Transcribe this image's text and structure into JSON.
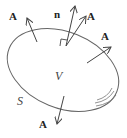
{
  "diagram": {
    "labels": {
      "vector_top_left": "A",
      "normal": "n",
      "vector_top_right": "A",
      "vector_right": "A",
      "vector_bottom": "A",
      "volume": "V",
      "surface": "S"
    },
    "colors": {
      "stroke": "#555555",
      "text": "#222222",
      "background": "#ffffff"
    }
  }
}
